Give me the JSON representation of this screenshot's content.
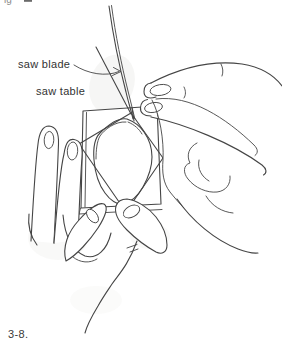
{
  "page": {
    "ink_color": "#454545",
    "paper_color": "#ffffff"
  },
  "figure": {
    "caption": "3-8.",
    "top_cropped_text": "ig",
    "labels": {
      "saw_blade": "saw blade",
      "saw_table": "saw table"
    }
  }
}
